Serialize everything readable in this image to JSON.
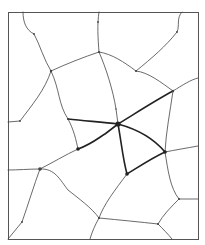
{
  "diagram": {
    "type": "network-graph",
    "frame": {
      "x": 8,
      "y": 12,
      "w": 190,
      "h": 227
    },
    "colors": {
      "background": "#ffffff",
      "edge": "#444444",
      "highlight": "#222222",
      "frame": "#555555"
    },
    "nodes": [
      {
        "id": "hub",
        "x": 118,
        "y": 124,
        "r": 2.6,
        "emphasis": true
      },
      {
        "id": "A",
        "x": 78,
        "y": 149,
        "r": 1.8,
        "emphasis": true
      },
      {
        "id": "B",
        "x": 127,
        "y": 174,
        "r": 1.8,
        "emphasis": true
      },
      {
        "id": "C",
        "x": 165,
        "y": 152,
        "r": 1.8,
        "emphasis": true
      },
      {
        "id": "D",
        "x": 173,
        "y": 91,
        "r": 1.2
      },
      {
        "id": "E",
        "x": 68,
        "y": 119,
        "r": 1.0
      },
      {
        "id": "F",
        "x": 51,
        "y": 71,
        "r": 1.2
      },
      {
        "id": "G",
        "x": 99,
        "y": 52,
        "r": 1.0
      },
      {
        "id": "H",
        "x": 136,
        "y": 71,
        "r": 1.0
      },
      {
        "id": "I",
        "x": 40,
        "y": 169,
        "r": 1.8
      },
      {
        "id": "J",
        "x": 99,
        "y": 218,
        "r": 1.0
      },
      {
        "id": "K",
        "x": 158,
        "y": 224,
        "r": 1.0
      },
      {
        "id": "L",
        "x": 179,
        "y": 199,
        "r": 1.0
      },
      {
        "id": "M",
        "x": 34,
        "y": 34,
        "r": 0.9
      },
      {
        "id": "N",
        "x": 98,
        "y": 22,
        "r": 0.9
      },
      {
        "id": "O",
        "x": 177,
        "y": 32,
        "r": 0.9
      },
      {
        "id": "P",
        "x": 20,
        "y": 121,
        "r": 0.9
      },
      {
        "id": "Q",
        "x": 22,
        "y": 222,
        "r": 0.9
      },
      {
        "id": "R",
        "x": 116,
        "y": 109,
        "r": 0.7
      },
      {
        "id": "S",
        "x": 105,
        "y": 134,
        "r": 0.7
      }
    ],
    "edges": [
      {
        "d": "M23,12 C23,22 26,30 34,34 C40,45 44,60 51,71",
        "bold": false
      },
      {
        "d": "M51,71 C66,64 84,57 99,52",
        "bold": false
      },
      {
        "d": "M99,12 C97,25 98,38 99,52",
        "bold": false
      },
      {
        "d": "M99,52 C106,68 113,90 116,109 L118,124",
        "bold": false
      },
      {
        "d": "M99,52 C112,54 124,62 136,71",
        "bold": false
      },
      {
        "d": "M136,71 C148,72 162,83 173,91",
        "bold": false
      },
      {
        "d": "M136,71 C152,58 166,46 177,32 C180,26 176,18 182,12",
        "bold": false
      },
      {
        "d": "M173,91 C183,85 190,80 198,78",
        "bold": false
      },
      {
        "d": "M51,71 C45,90 32,105 20,121 L8,122",
        "bold": false
      },
      {
        "d": "M51,71 C60,90 58,104 68,119",
        "bold": false
      },
      {
        "d": "M68,119 C74,130 76,140 78,149",
        "bold": false
      },
      {
        "d": "M68,119 C85,121 102,122 118,124",
        "bold": true
      },
      {
        "d": "M118,124 C136,113 156,100 173,91",
        "bold": true
      },
      {
        "d": "M78,149 C92,144 101,136 105,134 L118,124",
        "bold": true
      },
      {
        "d": "M118,124 C140,130 155,140 165,152",
        "bold": true
      },
      {
        "d": "M118,124 C121,140 123,160 127,174",
        "bold": true
      },
      {
        "d": "M127,174 C140,166 152,158 165,152",
        "bold": true
      },
      {
        "d": "M173,91 C170,112 166,132 165,152",
        "bold": false
      },
      {
        "d": "M165,152 C175,150 187,148 198,146",
        "bold": false
      },
      {
        "d": "M165,152 C168,170 170,188 179,199",
        "bold": false
      },
      {
        "d": "M179,199 C186,199 192,199 198,199",
        "bold": false
      },
      {
        "d": "M179,199 C171,207 163,215 158,224",
        "bold": false
      },
      {
        "d": "M158,224 C163,229 168,234 172,239",
        "bold": false
      },
      {
        "d": "M99,218 C120,220 140,222 158,224",
        "bold": false
      },
      {
        "d": "M127,174 C115,190 104,204 99,218",
        "bold": false
      },
      {
        "d": "M99,218 C95,225 92,232 90,239",
        "bold": false
      },
      {
        "d": "M78,149 C65,155 52,163 40,169",
        "bold": false
      },
      {
        "d": "M40,169 C29,169 18,170 8,170",
        "bold": false
      },
      {
        "d": "M40,169 C55,168 60,180 68,190 C78,198 92,208 99,218",
        "bold": false
      },
      {
        "d": "M40,169 C34,185 28,205 22,222 L8,239",
        "bold": false
      }
    ]
  }
}
